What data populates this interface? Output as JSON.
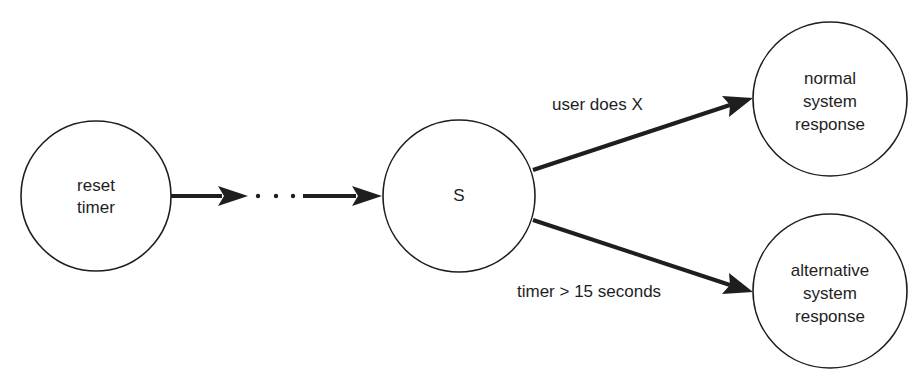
{
  "diagram": {
    "type": "state-transition",
    "colors": {
      "stroke": "#1e1e1e",
      "background": "#ffffff"
    },
    "nodes": [
      {
        "id": "reset-timer",
        "lines": [
          "reset",
          "timer"
        ],
        "cx": 96,
        "cy": 196,
        "r": 75
      },
      {
        "id": "s",
        "lines": [
          "S"
        ],
        "cx": 459,
        "cy": 196,
        "r": 76
      },
      {
        "id": "normal-system-response",
        "lines": [
          "normal",
          "system",
          "response"
        ],
        "cx": 830,
        "cy": 99,
        "r": 77
      },
      {
        "id": "alternative-system-response",
        "lines": [
          "alternative",
          "system",
          "response"
        ],
        "cx": 830,
        "cy": 291,
        "r": 77
      }
    ],
    "ellipsis": "· · ·",
    "edges": [
      {
        "from": "reset-timer",
        "to": "ellipsis",
        "label": ""
      },
      {
        "from": "ellipsis",
        "to": "s",
        "label": ""
      },
      {
        "from": "s",
        "to": "normal-system-response",
        "label": "user does X"
      },
      {
        "from": "s",
        "to": "alternative-system-response",
        "label": "timer > 15 seconds"
      }
    ]
  }
}
